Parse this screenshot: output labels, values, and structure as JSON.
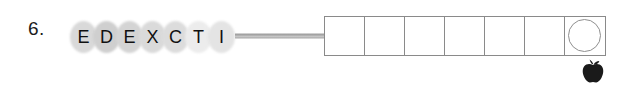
{
  "worksheet": {
    "item_number": "6.",
    "scramble": {
      "letters": [
        {
          "char": "E",
          "bubble_color": "#d9d9d9"
        },
        {
          "char": "D",
          "bubble_color": "#cfcfcf"
        },
        {
          "char": "E",
          "bubble_color": "#d4d4d4"
        },
        {
          "char": "X",
          "bubble_color": "#dadada"
        },
        {
          "char": "C",
          "bubble_color": "#dcdcdc"
        },
        {
          "char": "T",
          "bubble_color": "#ececec"
        },
        {
          "char": "I",
          "bubble_color": "#e4e4e4"
        }
      ],
      "scrambled_word": "EDEXCTI"
    },
    "connector": {
      "shape": "horizontal-bar",
      "color": "#9a9a9a"
    },
    "answer_row": {
      "box_count": 7,
      "boxes": [
        {
          "value": "",
          "circled": false
        },
        {
          "value": "",
          "circled": false
        },
        {
          "value": "",
          "circled": false
        },
        {
          "value": "",
          "circled": false
        },
        {
          "value": "",
          "circled": false
        },
        {
          "value": "",
          "circled": false
        },
        {
          "value": "",
          "circled": true
        }
      ],
      "border_color": "#8a8a8a",
      "circle_color": "#8f8f8f"
    },
    "decoration": {
      "icon": "apple-icon",
      "color": "#1a1a1a"
    }
  }
}
